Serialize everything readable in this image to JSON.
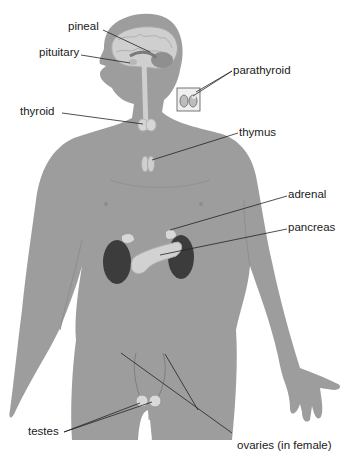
{
  "diagram": {
    "type": "anatomical illustration",
    "colors": {
      "body": "#9b9b9b",
      "body_shadow": "#8a8a8a",
      "brain": "#cfcfcf",
      "kidney": "#3c3c3c",
      "gland": "#d6d6d6",
      "line": "#222222",
      "text": "#1a1a1a",
      "background": "#ffffff"
    },
    "labels": [
      {
        "id": "pineal",
        "text": "pineal",
        "x": 68,
        "y": 21
      },
      {
        "id": "pituitary",
        "text": "pituitary",
        "x": 39,
        "y": 47
      },
      {
        "id": "parathyroid",
        "text": "parathyroid",
        "x": 233,
        "y": 65
      },
      {
        "id": "thyroid",
        "text": "thyroid",
        "x": 20,
        "y": 106
      },
      {
        "id": "thymus",
        "text": "thymus",
        "x": 239,
        "y": 127
      },
      {
        "id": "adrenal",
        "text": "adrenal",
        "x": 288,
        "y": 189
      },
      {
        "id": "pancreas",
        "text": "pancreas",
        "x": 288,
        "y": 222
      },
      {
        "id": "testes",
        "text": "testes",
        "x": 28,
        "y": 426
      },
      {
        "id": "ovaries",
        "text": "ovaries (in female)",
        "x": 237,
        "y": 440
      }
    ]
  }
}
